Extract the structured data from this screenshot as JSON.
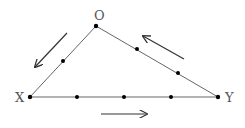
{
  "diagram": {
    "type": "triangle-flow",
    "vertices": [
      {
        "id": "O",
        "label": "O"
      },
      {
        "id": "X",
        "label": "X"
      },
      {
        "id": "Y",
        "label": "Y"
      }
    ],
    "edges": [
      {
        "from": "O",
        "to": "X",
        "intermediate_points": 1,
        "arrow_direction": "O to X"
      },
      {
        "from": "X",
        "to": "Y",
        "intermediate_points": 3,
        "arrow_direction": "X to Y"
      },
      {
        "from": "Y",
        "to": "O",
        "intermediate_points": 2,
        "arrow_direction": "Y to O"
      }
    ],
    "colors": {
      "line": "#666666",
      "point": "#000000",
      "arrow": "#333333",
      "label": "#555555"
    }
  }
}
